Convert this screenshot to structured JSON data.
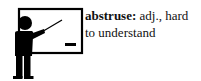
{
  "illustration": {
    "icon": "teacher-at-whiteboard-icon",
    "colors": {
      "ink": "#000000",
      "background": "#ffffff"
    }
  },
  "definition": {
    "term": "abstruse",
    "separator": ":",
    "part_of_speech": "adj.,",
    "meaning": "hard to understand"
  }
}
